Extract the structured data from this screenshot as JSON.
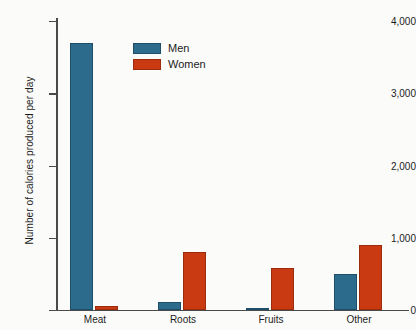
{
  "chart_data": {
    "type": "bar",
    "title": "",
    "xlabel": "",
    "ylabel": "Number of calories produced per day",
    "categories": [
      "Meat",
      "Roots",
      "Fruits",
      "Other"
    ],
    "series": [
      {
        "name": "Men",
        "color": "#2d6b8c",
        "values": [
          3700,
          110,
          25,
          500
        ]
      },
      {
        "name": "Women",
        "color": "#c93912",
        "values": [
          60,
          800,
          580,
          900
        ]
      }
    ],
    "ylim": [
      0,
      4000
    ],
    "yticks": [
      0,
      1000,
      2000,
      3000,
      4000
    ],
    "ytick_labels": [
      "0",
      "1,000",
      "2,000",
      "3,000",
      "4,000"
    ],
    "grid": false,
    "legend_position": "top-left-inside",
    "background_color": "#fbfbfa",
    "axis_color": "#4a4a4a"
  }
}
